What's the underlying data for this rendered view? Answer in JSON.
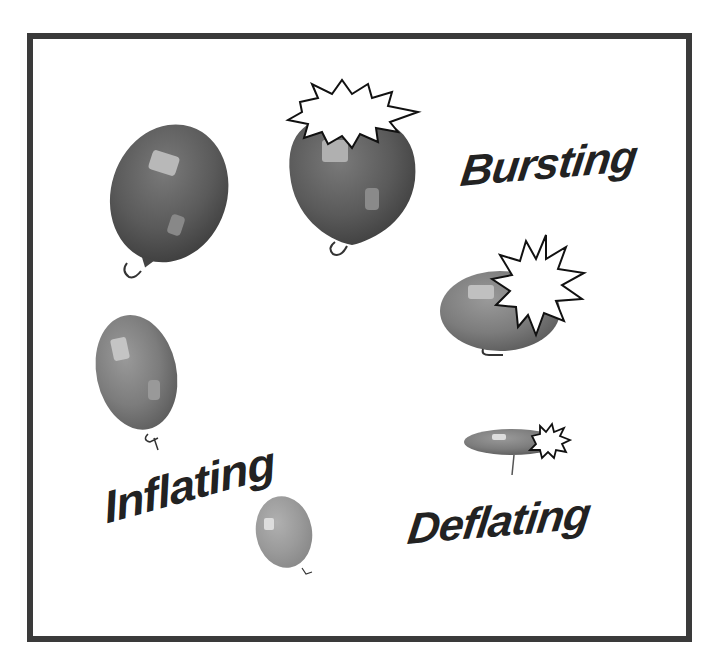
{
  "figure": {
    "labels": {
      "bursting": "Bursting",
      "inflating": "Inflating",
      "deflating": "Deflating"
    },
    "balloons": [
      {
        "name": "large-balloon",
        "state": "full"
      },
      {
        "name": "bursting-balloon-top",
        "state": "bursting"
      },
      {
        "name": "bursting-balloon-side",
        "state": "bursting"
      },
      {
        "name": "deflated-balloon",
        "state": "bursting-flat"
      },
      {
        "name": "medium-balloon",
        "state": "inflating"
      },
      {
        "name": "small-balloon",
        "state": "inflating"
      }
    ],
    "colors": {
      "frame": "#3a3a3a",
      "balloon_dark": "#555555",
      "balloon_mid": "#7a7a7a",
      "balloon_light": "#9a9a9a",
      "text": "#222222"
    }
  }
}
